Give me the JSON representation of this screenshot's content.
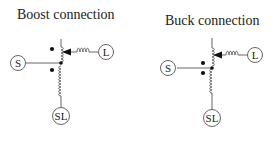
{
  "diagrams": [
    {
      "title": "Boost connection",
      "terminals": {
        "source": "S",
        "load": "L",
        "common": "SL"
      }
    },
    {
      "title": "Buck connection",
      "terminals": {
        "source": "S",
        "load": "L",
        "common": "SL"
      }
    }
  ],
  "colors": {
    "line": "#555555",
    "dot": "#111111",
    "text": "#222222"
  }
}
